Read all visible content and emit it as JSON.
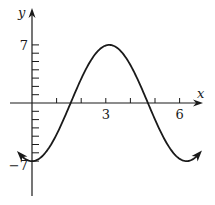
{
  "chart_data": {
    "type": "line",
    "title": "",
    "xlabel": "x",
    "ylabel": "y",
    "function": "y = -7 cos(x)",
    "amplitude": 7,
    "xlim": [
      -1.2,
      7.6
    ],
    "ylim": [
      -11,
      11
    ],
    "x_range_of_curve": [
      -0.5,
      6.8
    ],
    "x_ticks": [
      1,
      2,
      3,
      4,
      5,
      6
    ],
    "x_tick_labels": [
      {
        "value": 3,
        "label": "3"
      },
      {
        "value": 6,
        "label": "6"
      }
    ],
    "y_ticks": [
      -7,
      -6,
      -5,
      -4,
      -3,
      -2,
      -1,
      1,
      2,
      3,
      4,
      5,
      6,
      7
    ],
    "y_tick_labels": [
      {
        "value": 7,
        "label": "7"
      },
      {
        "value": -7,
        "label": "−7"
      }
    ],
    "key_points": [
      {
        "x": 0,
        "y": -7
      },
      {
        "x": 3.14,
        "y": 7
      },
      {
        "x": 6.28,
        "y": -7
      }
    ],
    "arrows_on_curve_ends": true,
    "grid": false,
    "legend": "none"
  }
}
